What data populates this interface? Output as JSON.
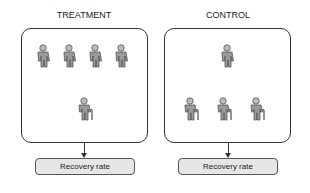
{
  "groups": [
    {
      "title": "TREATMENT",
      "young": 4,
      "elderly": 1,
      "outcome": "Recovery rate"
    },
    {
      "title": "CONTROL",
      "young": 1,
      "elderly": 3,
      "outcome": "Recovery rate"
    }
  ],
  "colors": {
    "figure_fill": "#9a9a9a",
    "figure_stroke": "#555555",
    "box_fill": "#e6e6e6",
    "border": "#333333"
  }
}
